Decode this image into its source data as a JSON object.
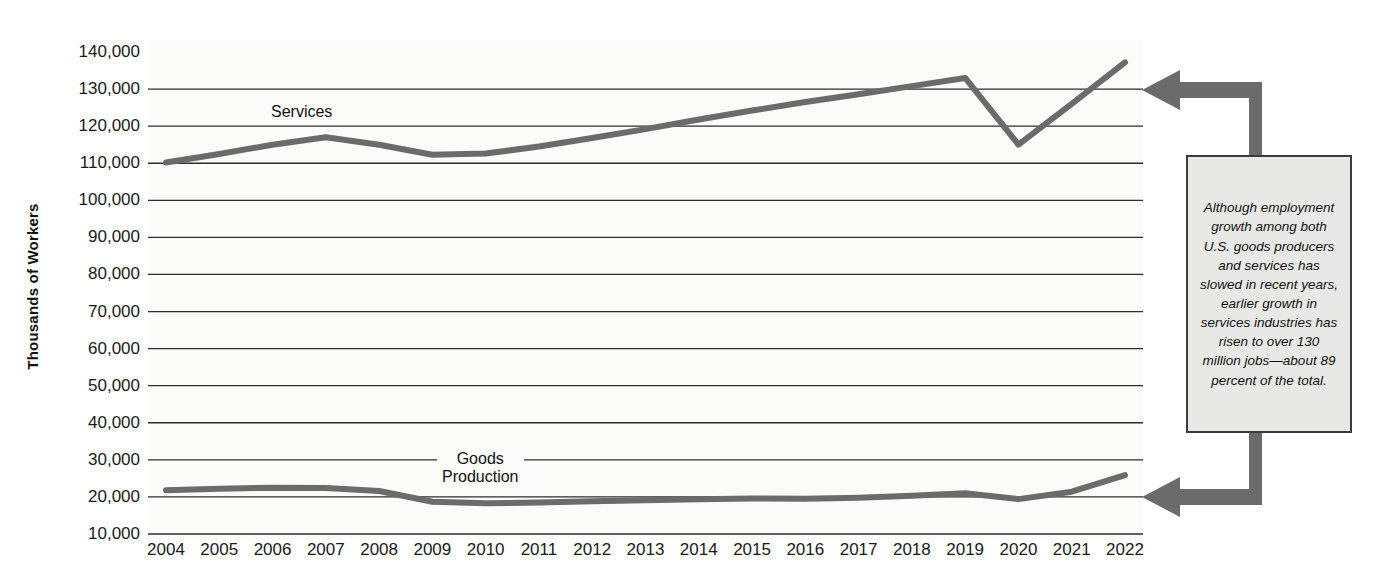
{
  "chart_data": {
    "type": "line",
    "title": "",
    "xlabel": "",
    "ylabel": "Thousands of Workers",
    "x": [
      2004,
      2005,
      2006,
      2007,
      2008,
      2009,
      2010,
      2011,
      2012,
      2013,
      2014,
      2015,
      2016,
      2017,
      2018,
      2019,
      2020,
      2021,
      2022
    ],
    "categories": [
      "2004",
      "2005",
      "2006",
      "2007",
      "2008",
      "2009",
      "2010",
      "2011",
      "2012",
      "2013",
      "2014",
      "2015",
      "2016",
      "2017",
      "2018",
      "2019",
      "2020",
      "2021",
      "2022"
    ],
    "ylim": [
      10000,
      140000
    ],
    "yticks": [
      140000,
      130000,
      120000,
      110000,
      100000,
      90000,
      80000,
      70000,
      60000,
      50000,
      40000,
      30000,
      20000,
      10000
    ],
    "ytick_labels": [
      "140,000",
      "130,000",
      "120,000",
      "110,000",
      "100,000",
      "90,000",
      "80,000",
      "70,000",
      "60,000",
      "50,000",
      "40,000",
      "30,000",
      "20,000",
      "10,000"
    ],
    "grid": true,
    "legend_position": "inline-labels",
    "series": [
      {
        "name": "Services",
        "label": "Services",
        "color": "#6b6b6b",
        "values": [
          110200,
          112500,
          115000,
          117000,
          115000,
          112300,
          112600,
          114500,
          116800,
          119200,
          121800,
          124200,
          126500,
          128600,
          130800,
          133000,
          115000,
          126000,
          137200
        ]
      },
      {
        "name": "Goods Production",
        "label": "Goods\nProduction",
        "label_line1": "Goods",
        "label_line2": "Production",
        "color": "#6b6b6b",
        "values": [
          21800,
          22200,
          22500,
          22400,
          21600,
          18700,
          18300,
          18500,
          18800,
          19100,
          19400,
          19600,
          19500,
          19800,
          20300,
          21000,
          19400,
          21400,
          25900
        ]
      }
    ],
    "annotations": [
      {
        "id": "callout",
        "text": "Although employment growth among both U.S. goods producers and services has slowed in recent years, earlier growth in services industries has risen to over 130 million jobs—about 89 percent of the total.",
        "box_fill": "#e8e8e6",
        "box_border": "#3b3b3b",
        "arrow_color": "#6b6b6b",
        "points_to": [
          "Services 2022",
          "Goods Production 2022"
        ]
      }
    ]
  }
}
